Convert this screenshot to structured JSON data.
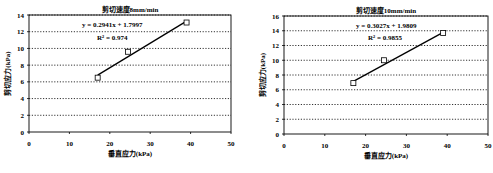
{
  "chart_data": [
    {
      "type": "scatter",
      "title": "剪切速度8mm/min",
      "xlabel": "垂直应力(kPa)",
      "ylabel": "剪切应力(kPa)",
      "xlim": [
        0,
        50
      ],
      "ylim": [
        0,
        14
      ],
      "xticks": [
        0,
        10,
        20,
        30,
        40,
        50
      ],
      "yticks": [
        0,
        2,
        4,
        6,
        8,
        10,
        12,
        14
      ],
      "grid": "horizontal-dotted",
      "points": [
        {
          "x": 17,
          "y": 6.5
        },
        {
          "x": 24.5,
          "y": 9.6
        },
        {
          "x": 39,
          "y": 13.1
        }
      ],
      "trendline": {
        "slope": 0.2941,
        "intercept": 1.7997,
        "x_range": [
          17,
          39
        ]
      },
      "equation": "y = 0.2941x + 1.7997",
      "r2": "R² = 0.974",
      "marker": "open-square"
    },
    {
      "type": "scatter",
      "title": "剪切速度10mm/min",
      "xlabel": "垂直应力(kPa)",
      "ylabel": "剪切应力(kPa)",
      "xlim": [
        0,
        50
      ],
      "ylim": [
        0,
        16
      ],
      "xticks": [
        0,
        10,
        20,
        30,
        40,
        50
      ],
      "yticks": [
        0,
        2,
        4,
        6,
        8,
        10,
        12,
        14,
        16
      ],
      "grid": "horizontal-dotted",
      "points": [
        {
          "x": 17,
          "y": 6.9
        },
        {
          "x": 24.5,
          "y": 10.0
        },
        {
          "x": 39,
          "y": 13.7
        }
      ],
      "trendline": {
        "slope": 0.3027,
        "intercept": 1.9809,
        "x_range": [
          17,
          39
        ]
      },
      "equation": "y = 0.3027x + 1.9809",
      "r2": "R² = 0.9855",
      "marker": "open-square"
    }
  ]
}
